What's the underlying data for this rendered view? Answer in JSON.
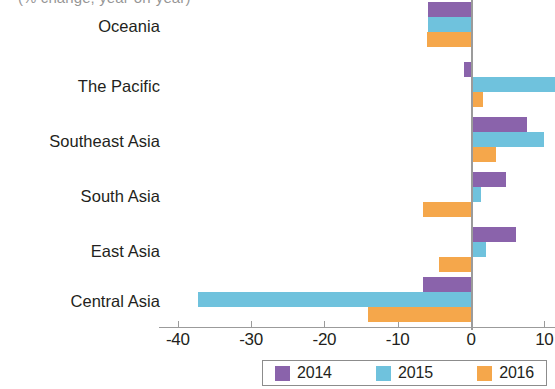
{
  "chart_data": {
    "type": "bar",
    "orientation": "horizontal",
    "title": "(% change, year-on-year)",
    "xlabel": "",
    "ylabel": "",
    "categories": [
      "Central Asia",
      "East Asia",
      "South Asia",
      "Southeast Asia",
      "The Pacific",
      "Oceania"
    ],
    "series": [
      {
        "name": "2014",
        "color": "#8a63ab",
        "values": [
          -6.6,
          6.2,
          4.8,
          7.7,
          -1.0,
          -5.8
        ]
      },
      {
        "name": "2015",
        "color": "#6fc2dd",
        "values": [
          -37.2,
          2.0,
          1.3,
          9.9,
          11.5,
          -5.8
        ]
      },
      {
        "name": "2016",
        "color": "#f5a74b",
        "values": [
          -14.0,
          -4.3,
          -6.5,
          3.4,
          1.6,
          -6.0
        ]
      }
    ],
    "xticks": [
      -40,
      -30,
      -20,
      -10,
      0,
      10
    ],
    "xtick_labels": [
      "-40",
      "-30",
      "-20",
      "-10",
      "0",
      "10"
    ],
    "xlim": [
      -42.5,
      11.5
    ],
    "grid": false,
    "legend_position": "bottom"
  },
  "legend": {
    "items": [
      {
        "label": "2014",
        "color": "#8a63ab"
      },
      {
        "label": "2015",
        "color": "#6fc2dd"
      },
      {
        "label": "2016",
        "color": "#f5a74b"
      }
    ]
  },
  "axis": {
    "tick_labels": [
      "-40",
      "-30",
      "-20",
      "-10",
      "0",
      "10"
    ]
  },
  "categories": [
    "Oceania",
    "The Pacific",
    "Southeast Asia",
    "South Asia",
    "East Asia",
    "Central Asia"
  ]
}
